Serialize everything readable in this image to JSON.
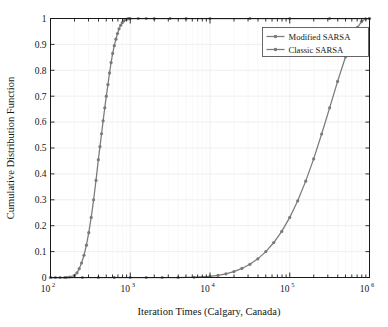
{
  "chart_data": {
    "type": "line",
    "title": "",
    "xlabel": "Iteration Times (Calgary, Canada)",
    "ylabel": "Cumulative Distribution Function",
    "xscale": "log",
    "yscale": "linear",
    "xlim": [
      100,
      1000000
    ],
    "ylim": [
      0,
      1
    ],
    "grid": true,
    "legend_position": "top-right",
    "xtick_labels": [
      "10",
      "10",
      "10",
      "10",
      "10"
    ],
    "xtick_exponents": [
      "2",
      "3",
      "4",
      "5",
      "6"
    ],
    "xtick_values": [
      100,
      1000,
      10000,
      100000,
      1000000
    ],
    "ytick_labels": [
      "0",
      "0.1",
      "0.2",
      "0.3",
      "0.4",
      "0.5",
      "0.6",
      "0.7",
      "0.8",
      "0.9",
      "1"
    ],
    "ytick_values": [
      0,
      0.1,
      0.2,
      0.3,
      0.4,
      0.5,
      0.6,
      0.7,
      0.8,
      0.9,
      1
    ],
    "series": [
      {
        "name": "Modified SARSA",
        "color": "#7a7a7a",
        "marker": "circle",
        "x": [
          100,
          115,
          132,
          151,
          174,
          200,
          215,
          229,
          245,
          263,
          282,
          302,
          324,
          347,
          372,
          398,
          417,
          437,
          457,
          479,
          501,
          525,
          550,
          575,
          602,
          631,
          661,
          692,
          724,
          759,
          794,
          832,
          871,
          912,
          955,
          1000,
          1259,
          1585,
          2000,
          3162,
          5012,
          10000,
          31623,
          100000,
          316228,
          1000000
        ],
        "y": [
          0.0,
          0.0,
          0.0,
          0.0,
          0.002,
          0.008,
          0.018,
          0.034,
          0.056,
          0.086,
          0.125,
          0.173,
          0.232,
          0.3,
          0.375,
          0.455,
          0.505,
          0.555,
          0.605,
          0.655,
          0.7,
          0.745,
          0.79,
          0.83,
          0.865,
          0.895,
          0.92,
          0.942,
          0.96,
          0.974,
          0.984,
          0.991,
          0.996,
          0.998,
          0.9995,
          1.0,
          1.0,
          1.0,
          1.0,
          1.0,
          1.0,
          1.0,
          1.0,
          1.0,
          1.0,
          1.0
        ]
      },
      {
        "name": "Classic SARSA",
        "color": "#7a7a7a",
        "marker": "circle",
        "x": [
          100,
          158,
          251,
          398,
          631,
          1000,
          1585,
          2512,
          3981,
          6310,
          10000,
          12589,
          15849,
          19953,
          25119,
          31623,
          39811,
          50119,
          63096,
          79433,
          100000,
          125893,
          158489,
          199526,
          251189,
          316228,
          398107,
          501187,
          630957,
          707946,
          794328,
          891251,
          1000000
        ],
        "y": [
          0.0,
          0.0,
          0.0,
          0.0,
          0.0,
          0.0,
          0.0,
          0.0,
          0.0,
          0.001,
          0.004,
          0.008,
          0.014,
          0.023,
          0.035,
          0.051,
          0.072,
          0.1,
          0.135,
          0.178,
          0.232,
          0.296,
          0.372,
          0.458,
          0.554,
          0.655,
          0.757,
          0.852,
          0.934,
          0.966,
          0.988,
          0.999,
          1.0
        ]
      }
    ]
  },
  "legend": {
    "entries": [
      {
        "label": "Modified SARSA"
      },
      {
        "label": "Classic SARSA"
      }
    ]
  },
  "colors": {
    "axis": "#1a1a1a",
    "grid": "#e8e8e8",
    "series": "#7a7a7a",
    "background": "#ffffff"
  }
}
